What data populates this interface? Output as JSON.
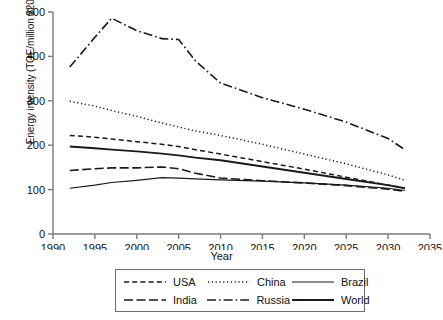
{
  "chart_data": {
    "type": "line",
    "title": "",
    "xlabel": "Year",
    "ylabel": "Energy intensity (TOE/million $2010 PPP)",
    "xlim": [
      1990,
      2035
    ],
    "ylim": [
      0,
      500
    ],
    "xticks": [
      1990,
      1995,
      2000,
      2005,
      2010,
      2015,
      2020,
      2025,
      2030,
      2035
    ],
    "yticks": [
      0,
      100,
      200,
      300,
      400,
      500
    ],
    "grid": false,
    "legend_position": "bottom",
    "x": [
      1992,
      1995,
      1997,
      2000,
      2003,
      2005,
      2007,
      2010,
      2015,
      2020,
      2025,
      2030,
      2032
    ],
    "series": [
      {
        "name": "USA",
        "style": "dashed",
        "values": [
          222,
          218,
          214,
          208,
          202,
          197,
          190,
          180,
          163,
          146,
          128,
          110,
          103
        ]
      },
      {
        "name": "China",
        "style": "dotted",
        "values": [
          299,
          288,
          278,
          265,
          250,
          241,
          232,
          222,
          202,
          180,
          158,
          133,
          121
        ]
      },
      {
        "name": "Brazil",
        "style": "solid-thin",
        "values": [
          103,
          110,
          116,
          121,
          127,
          126,
          124,
          122,
          119,
          115,
          110,
          103,
          98
        ]
      },
      {
        "name": "India",
        "style": "long-dash",
        "values": [
          143,
          147,
          149,
          149,
          151,
          147,
          137,
          126,
          120,
          115,
          109,
          101,
          96
        ]
      },
      {
        "name": "Russia",
        "style": "dash-dot",
        "values": [
          376,
          443,
          486,
          458,
          440,
          438,
          390,
          340,
          307,
          281,
          252,
          215,
          190
        ]
      },
      {
        "name": "World",
        "style": "solid-thick",
        "values": [
          197,
          193,
          190,
          186,
          181,
          177,
          172,
          166,
          152,
          138,
          124,
          110,
          103
        ]
      }
    ]
  },
  "legend": {
    "rows": [
      [
        {
          "label": "USA",
          "swatch": "dashed"
        },
        {
          "label": "China",
          "swatch": "dotted"
        },
        {
          "label": "Brazil",
          "swatch": "solid-thin"
        }
      ],
      [
        {
          "label": "India",
          "swatch": "long-dash"
        },
        {
          "label": "Russia",
          "swatch": "dash-dot"
        },
        {
          "label": "World",
          "swatch": "solid-thick"
        }
      ]
    ]
  },
  "colors": {
    "line": "#1a1a1a",
    "axis": "#7a7a7a",
    "text": "#111111",
    "background": "#ffffff"
  }
}
